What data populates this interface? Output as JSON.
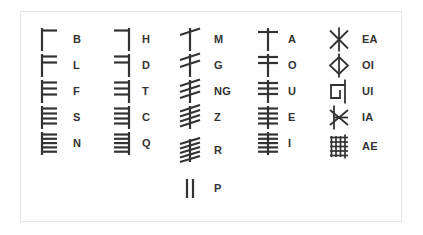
{
  "chart": {
    "background_color": "#ffffff",
    "border_color": "#e6e6e6",
    "stroke_color": "#333333",
    "label_color": "#333333"
  },
  "columns": [
    {
      "name": "aicme-beithe",
      "stroke_style": "right-of-stem",
      "entries": [
        {
          "label": "B",
          "strokes": 1,
          "glyph": "ogham-b"
        },
        {
          "label": "L",
          "strokes": 2,
          "glyph": "ogham-l"
        },
        {
          "label": "F",
          "strokes": 3,
          "glyph": "ogham-f"
        },
        {
          "label": "S",
          "strokes": 4,
          "glyph": "ogham-s"
        },
        {
          "label": "N",
          "strokes": 5,
          "glyph": "ogham-n"
        }
      ]
    },
    {
      "name": "aicme-huatha",
      "stroke_style": "left-of-stem",
      "entries": [
        {
          "label": "H",
          "strokes": 1,
          "glyph": "ogham-h"
        },
        {
          "label": "D",
          "strokes": 2,
          "glyph": "ogham-d"
        },
        {
          "label": "T",
          "strokes": 3,
          "glyph": "ogham-t"
        },
        {
          "label": "C",
          "strokes": 4,
          "glyph": "ogham-c"
        },
        {
          "label": "Q",
          "strokes": 5,
          "glyph": "ogham-q"
        }
      ]
    },
    {
      "name": "aicme-muine",
      "stroke_style": "diagonal-across-stem",
      "entries": [
        {
          "label": "M",
          "strokes": 1,
          "glyph": "ogham-m"
        },
        {
          "label": "G",
          "strokes": 2,
          "glyph": "ogham-g"
        },
        {
          "label": "NG",
          "strokes": 3,
          "glyph": "ogham-ng"
        },
        {
          "label": "Z",
          "strokes": 4,
          "glyph": "ogham-z"
        },
        {
          "label": "R",
          "strokes": 5,
          "glyph": "ogham-r"
        },
        {
          "label": "P",
          "strokes": 2,
          "glyph": "ogham-p"
        }
      ]
    },
    {
      "name": "aicme-ailme",
      "stroke_style": "across-stem",
      "entries": [
        {
          "label": "A",
          "strokes": 1,
          "glyph": "ogham-a"
        },
        {
          "label": "O",
          "strokes": 2,
          "glyph": "ogham-o"
        },
        {
          "label": "U",
          "strokes": 3,
          "glyph": "ogham-u"
        },
        {
          "label": "E",
          "strokes": 4,
          "glyph": "ogham-e"
        },
        {
          "label": "I",
          "strokes": 5,
          "glyph": "ogham-i"
        }
      ]
    },
    {
      "name": "forfeda",
      "stroke_style": "special",
      "entries": [
        {
          "label": "EA",
          "strokes": 0,
          "glyph": "ogham-ea-star"
        },
        {
          "label": "OI",
          "strokes": 0,
          "glyph": "ogham-oi-diamond"
        },
        {
          "label": "UI",
          "strokes": 0,
          "glyph": "ogham-ui-hook"
        },
        {
          "label": "IA",
          "strokes": 0,
          "glyph": "ogham-ia-arrow"
        },
        {
          "label": "AE",
          "strokes": 0,
          "glyph": "ogham-ae-grid"
        }
      ]
    }
  ]
}
